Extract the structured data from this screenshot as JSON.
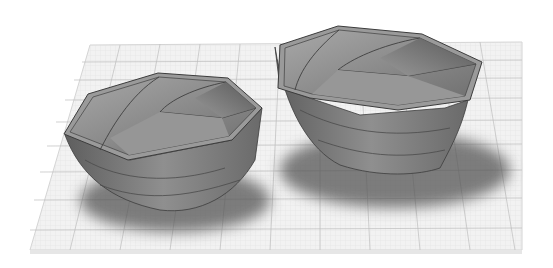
{
  "scene": {
    "description": "3D render of two twisted octagonal bowls on a grid workplane",
    "background_color": "#ffffff",
    "workplane": {
      "fill": "#f1f1f1",
      "major_line_color": "#b9b9b9",
      "minor_line_color": "#dcdcdc",
      "edge_color": "#d6d6d6"
    },
    "bowls": [
      {
        "name": "small-bowl",
        "fill": "#8a8a8a",
        "rim_color": "#9a9a9a",
        "edge_color": "#3c3c3c"
      },
      {
        "name": "large-bowl",
        "fill": "#8a8a8a",
        "rim_color": "#9a9a9a",
        "edge_color": "#3c3c3c"
      }
    ],
    "shadow_color": "#5a5a5a"
  }
}
